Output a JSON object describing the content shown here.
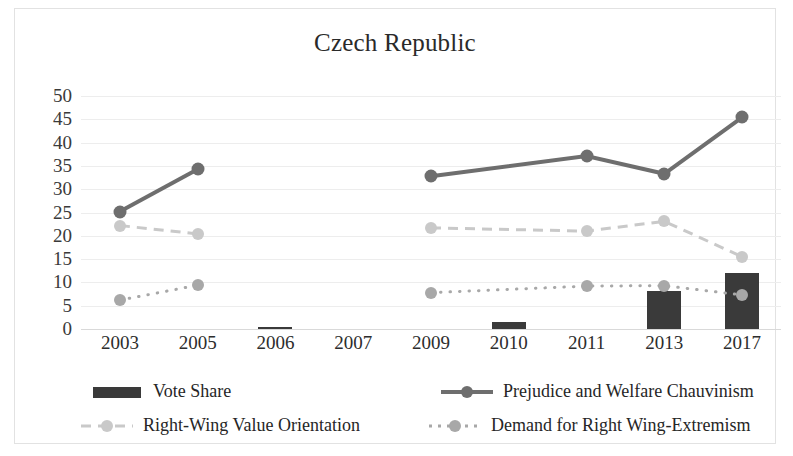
{
  "chart_data": {
    "type": "line",
    "title": "Czech Republic",
    "xlabel": "",
    "ylabel": "",
    "ylim": [
      0,
      50
    ],
    "yticks": [
      0,
      5,
      10,
      15,
      20,
      25,
      30,
      35,
      40,
      45,
      50
    ],
    "grid": true,
    "legend_position": "bottom",
    "categories": [
      "2003",
      "2005",
      "2006",
      "2007",
      "2009",
      "2010",
      "2011",
      "2013",
      "2017"
    ],
    "series": [
      {
        "name": "Vote Share",
        "type": "bar",
        "color": "#3a3a3a",
        "values": [
          null,
          null,
          0.3,
          null,
          null,
          1.5,
          null,
          8.2,
          12.0
        ]
      },
      {
        "name": "Prejudice and Welfare Chauvinism",
        "type": "line",
        "color": "#6e6e6e",
        "linestyle": "solid",
        "values": [
          25.2,
          34.3,
          null,
          null,
          32.8,
          null,
          37.1,
          33.3,
          45.4
        ]
      },
      {
        "name": "Right-Wing Value Orientation",
        "type": "line",
        "color": "#c9c9c9",
        "linestyle": "dashed",
        "values": [
          22.2,
          20.4,
          null,
          null,
          21.7,
          null,
          21.0,
          23.1,
          15.5
        ]
      },
      {
        "name": "Demand for Right Wing-Extremism",
        "type": "line",
        "color": "#a8a8a8",
        "linestyle": "dotted",
        "values": [
          6.2,
          9.4,
          null,
          null,
          7.8,
          null,
          9.2,
          9.3,
          7.3
        ]
      }
    ]
  },
  "legend": {
    "items": [
      {
        "label": "Vote Share",
        "marker": "bar-swatch",
        "color": "#3a3a3a"
      },
      {
        "label": "Prejudice and Welfare Chauvinism",
        "marker": "solid-line-dot",
        "color": "#6e6e6e"
      },
      {
        "label": "Right-Wing Value Orientation",
        "marker": "dashed-line-dot",
        "color": "#c9c9c9"
      },
      {
        "label": "Demand for Right Wing-Extremism",
        "marker": "dotted-line-dot",
        "color": "#a8a8a8"
      }
    ]
  }
}
